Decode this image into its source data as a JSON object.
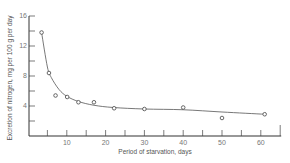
{
  "chart_data": {
    "type": "scatter",
    "title": "",
    "xlabel": "Period of starvation, days",
    "ylabel": "Excretion of nitrogen, mg per 100 g per day",
    "xlim": [
      0,
      65
    ],
    "ylim": [
      0,
      16
    ],
    "x_ticks": [
      10,
      20,
      30,
      40,
      50,
      60
    ],
    "x_minor_ticks": [
      5,
      15,
      25,
      35,
      45,
      55,
      65
    ],
    "y_ticks": [
      4,
      8,
      12,
      16
    ],
    "y_minor_ticks": [
      2,
      6,
      10,
      14
    ],
    "grid": false,
    "legend": null,
    "series": [
      {
        "name": "observed",
        "marker": "open-circle",
        "x": [
          3.5,
          5.4,
          7.1,
          10.1,
          13,
          17,
          22.2,
          30,
          40,
          50,
          61
        ],
        "y": [
          13.8,
          8.4,
          5.4,
          5.2,
          4.5,
          4.5,
          3.7,
          3.6,
          3.8,
          2.4,
          2.9
        ]
      },
      {
        "name": "fitted curve",
        "marker": "none",
        "line": "smooth",
        "x": [
          3.5,
          5,
          6,
          8,
          10,
          13,
          17,
          22,
          30,
          40,
          50,
          61
        ],
        "y": [
          13.8,
          9.2,
          7.8,
          6.2,
          5.3,
          4.6,
          4.1,
          3.8,
          3.6,
          3.5,
          3.2,
          2.9
        ]
      }
    ]
  }
}
